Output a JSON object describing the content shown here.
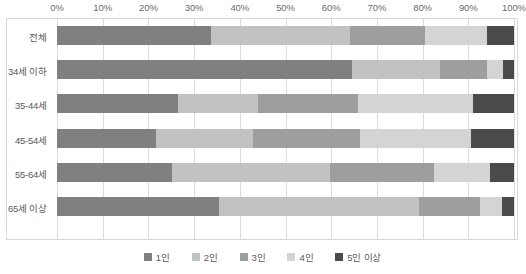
{
  "chart_data": {
    "type": "bar",
    "orientation": "horizontal",
    "stacked": true,
    "stack_mode": "percent",
    "title": "",
    "subtitle": "",
    "xlabel": "",
    "ylabel": "",
    "xlim": [
      0,
      100
    ],
    "grid": true,
    "grid_axis": "x",
    "legend_position": "bottom",
    "x_ticks": [
      0,
      10,
      20,
      30,
      40,
      50,
      60,
      70,
      80,
      90,
      100
    ],
    "x_tick_labels": [
      "0%",
      "10%",
      "20%",
      "30%",
      "40%",
      "50%",
      "60%",
      "70%",
      "80%",
      "90%",
      "100%"
    ],
    "categories": [
      "전체",
      "34세 이하",
      "35-44세",
      "45-54세",
      "55-64세",
      "65세 이상"
    ],
    "series": [
      {
        "name": "1인",
        "color": "#808080",
        "values": [
          33.7,
          64.6,
          26.5,
          21.7,
          25.2,
          35.5
        ]
      },
      {
        "name": "2인",
        "color": "#c2c2c2",
        "values": [
          30.4,
          19.2,
          17.5,
          21.2,
          34.5,
          43.7
        ]
      },
      {
        "name": "3인",
        "color": "#9e9e9e",
        "values": [
          16.4,
          10.3,
          21.9,
          23.4,
          22.8,
          13.4
        ]
      },
      {
        "name": "4인",
        "color": "#d4d4d4",
        "values": [
          13.6,
          3.5,
          25.2,
          24.3,
          12.2,
          4.8
        ]
      },
      {
        "name": "5인 이상",
        "color": "#4a4a4a",
        "values": [
          5.9,
          2.4,
          8.9,
          9.4,
          5.3,
          2.6
        ]
      }
    ]
  },
  "style": {
    "plot_border_color": "#d8d8d8",
    "grid_color": "#dcdcdc",
    "tick_label_color": "#6b6b6b",
    "category_label_color": "#5a5a5a",
    "legend_label_color": "#5a5a5a",
    "background": "#ffffff"
  }
}
